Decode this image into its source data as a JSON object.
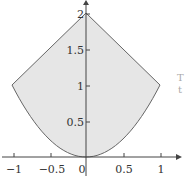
{
  "chart_data": {
    "type": "area",
    "title": "",
    "xlabel": "",
    "ylabel": "",
    "xlim": [
      -1.15,
      1.15
    ],
    "ylim": [
      0,
      2.1
    ],
    "grid": false,
    "x_ticks": [
      "-1",
      "-0.5",
      "0",
      "0.5",
      "1"
    ],
    "y_ticks": [
      "0.5",
      "1",
      "1.5",
      "2"
    ],
    "series": [
      {
        "name": "upper boundary y = 2 - |x|",
        "x": [
          -1,
          0,
          1
        ],
        "y": [
          1,
          2,
          1
        ]
      },
      {
        "name": "lower boundary y = x^2",
        "x": [
          -1,
          -0.5,
          0,
          0.5,
          1
        ],
        "y": [
          1,
          0.25,
          0,
          0.25,
          1
        ]
      }
    ],
    "fill_color": "#e6e6e6",
    "line_color": "#666666"
  },
  "labels": {
    "x0": "0",
    "xm1": "−1",
    "xm05": "−0.5",
    "x05": "0.5",
    "x1": "1",
    "y05": "0.5",
    "y1": "1",
    "y15": "1.5",
    "y2": "2",
    "frag1": "T",
    "frag2": "t"
  }
}
